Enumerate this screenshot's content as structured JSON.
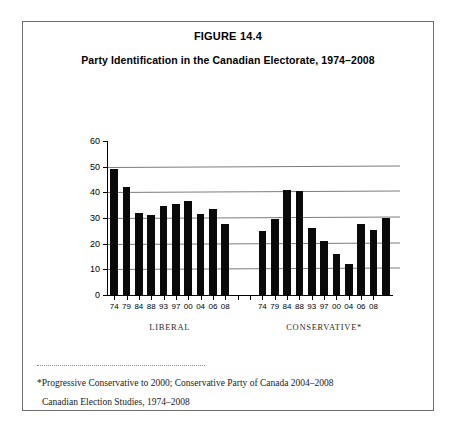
{
  "figure": {
    "number": "FIGURE 14.4",
    "title": "Party Identification in the Canadian Electorate, 1974–2008"
  },
  "footnotes": {
    "line1": "*Progressive Conservative to 2000; Conservative Party of Canada 2004–2008",
    "line2": "Canadian Election Studies, 1974–2008"
  },
  "chart_data": {
    "type": "bar",
    "title": "Party Identification in the Canadian Electorate, 1974–2008",
    "xlabel": "",
    "ylabel": "",
    "ylim": [
      0,
      60
    ],
    "yticks": [
      0,
      10,
      20,
      30,
      40,
      50,
      60
    ],
    "ytick_labels": [
      "0",
      "10",
      "20",
      "30",
      "40",
      "50",
      "60"
    ],
    "grid": true,
    "grid_axis": "y",
    "legend_position": "none",
    "bar_color": "#0a0a0a",
    "groups": [
      {
        "name": "LIBERAL",
        "label": "LIBERAL",
        "categories": [
          "74",
          "79",
          "84",
          "88",
          "93",
          "97",
          "00",
          "04",
          "06",
          "08"
        ],
        "values": [
          49,
          42,
          32,
          31,
          34.5,
          35.5,
          36.5,
          31.5,
          33.5,
          27.5
        ]
      },
      {
        "name": "CONSERVATIVE",
        "label": "CONSERVATIVE*",
        "categories": [
          "74",
          "79",
          "84",
          "88",
          "93",
          "97",
          "00",
          "04",
          "06",
          "08"
        ],
        "values": [
          25,
          29.5,
          41,
          40.5,
          26,
          21,
          16,
          12,
          27.5,
          25.5,
          30
        ]
      }
    ],
    "notes": [
      "*Progressive Conservative to 2000; Conservative Party of Canada 2004–2008",
      "Canadian Election Studies, 1974–2008"
    ]
  }
}
